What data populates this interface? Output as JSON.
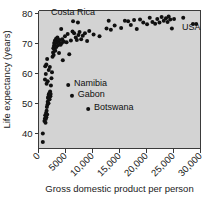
{
  "chart_data": {
    "type": "scatter",
    "title": "",
    "xlabel": "Gross domestic product per person",
    "ylabel": "Life expectancy (years)",
    "xlim": [
      0,
      30000
    ],
    "ylim": [
      35,
      81
    ],
    "grid": false,
    "legend": null,
    "xticks": [
      {
        "value": 0,
        "label": "0"
      },
      {
        "value": 5000,
        "label": "5000"
      },
      {
        "value": 10000,
        "label": "10,000"
      },
      {
        "value": 15000,
        "label": "15,000"
      },
      {
        "value": 20000,
        "label": "20,000"
      },
      {
        "value": 25000,
        "label": "25,000"
      },
      {
        "value": 30000,
        "label": "30,000"
      }
    ],
    "yticks": [
      {
        "value": 40,
        "label": "40"
      },
      {
        "value": 50,
        "label": "50"
      },
      {
        "value": 60,
        "label": "60"
      },
      {
        "value": 70,
        "label": "70"
      },
      {
        "value": 80,
        "label": "80"
      }
    ],
    "marker": {
      "shape": "circle",
      "color": "#101010",
      "size": 2.0
    },
    "annotations": [
      {
        "text": "Costa Rica",
        "x": 6400,
        "y": 79.6,
        "anchor": "mid",
        "dx": 0,
        "dy": 0
      },
      {
        "text": "Namibia",
        "x": 6000,
        "y": 56.2,
        "anchor": "left",
        "dx": 3,
        "dy": 1
      },
      {
        "text": "Gabon",
        "x": 6700,
        "y": 52.6,
        "anchor": "left",
        "dx": 3,
        "dy": 1
      },
      {
        "text": "Botswana",
        "x": 9700,
        "y": 48.2,
        "anchor": "left",
        "dx": 3,
        "dy": 1
      },
      {
        "text": "USA",
        "x": 28300,
        "y": 74.6,
        "anchor": "mid",
        "dx": 0,
        "dy": 0
      }
    ],
    "labeled_points": [
      {
        "name": "Costa Rica",
        "x": 6400,
        "y": 77.4
      },
      {
        "name": "Namibia",
        "x": 5500,
        "y": 56.2
      },
      {
        "name": "Gabon",
        "x": 6200,
        "y": 52.6
      },
      {
        "name": "Botswana",
        "x": 9200,
        "y": 48.2
      },
      {
        "name": "USA",
        "x": 28600,
        "y": 76.5
      },
      {
        "name": "USA-2",
        "x": 29200,
        "y": 76.5
      }
    ],
    "points": [
      [
        800,
        37.2
      ],
      [
        800,
        40.0
      ],
      [
        1100,
        44.2
      ],
      [
        1200,
        45.0
      ],
      [
        1250,
        46.1
      ],
      [
        1300,
        43.6
      ],
      [
        1350,
        44.8
      ],
      [
        1400,
        46.8
      ],
      [
        1450,
        45.4
      ],
      [
        1500,
        47.6
      ],
      [
        1550,
        48.8
      ],
      [
        1600,
        46.3
      ],
      [
        1650,
        49.6
      ],
      [
        1700,
        50.6
      ],
      [
        1750,
        51.8
      ],
      [
        1800,
        52.2
      ],
      [
        1850,
        50.1
      ],
      [
        1900,
        53.0
      ],
      [
        1950,
        52.6
      ],
      [
        2000,
        53.4
      ],
      [
        2050,
        51.4
      ],
      [
        2100,
        52.9
      ],
      [
        2150,
        54.0
      ],
      [
        2200,
        52.4
      ],
      [
        2250,
        53.2
      ],
      [
        1200,
        58.0
      ],
      [
        1350,
        59.8
      ],
      [
        1500,
        56.6
      ],
      [
        1700,
        57.4
      ],
      [
        1900,
        61.2
      ],
      [
        1250,
        62.4
      ],
      [
        1450,
        63.0
      ],
      [
        1600,
        64.8
      ],
      [
        2100,
        62.2
      ],
      [
        2300,
        56.0
      ],
      [
        2400,
        58.4
      ],
      [
        2500,
        60.4
      ],
      [
        2600,
        65.6
      ],
      [
        2700,
        67.0
      ],
      [
        2750,
        68.4
      ],
      [
        2800,
        66.2
      ],
      [
        2850,
        69.2
      ],
      [
        2900,
        70.2
      ],
      [
        2950,
        68.0
      ],
      [
        3000,
        69.8
      ],
      [
        3050,
        71.0
      ],
      [
        3100,
        67.6
      ],
      [
        3150,
        70.6
      ],
      [
        3200,
        69.0
      ],
      [
        3250,
        71.6
      ],
      [
        3300,
        68.8
      ],
      [
        3400,
        70.4
      ],
      [
        3500,
        72.0
      ],
      [
        3600,
        69.4
      ],
      [
        3700,
        70.8
      ],
      [
        3800,
        66.8
      ],
      [
        3900,
        71.2
      ],
      [
        4000,
        70.0
      ],
      [
        4100,
        69.6
      ],
      [
        4200,
        74.8
      ],
      [
        4300,
        70.2
      ],
      [
        4400,
        71.4
      ],
      [
        4500,
        64.4
      ],
      [
        4700,
        70.6
      ],
      [
        4900,
        72.4
      ],
      [
        5200,
        70.4
      ],
      [
        5400,
        73.2
      ],
      [
        5700,
        66.4
      ],
      [
        6000,
        71.0
      ],
      [
        6300,
        74.0
      ],
      [
        6600,
        73.4
      ],
      [
        6900,
        72.0
      ],
      [
        7100,
        71.2
      ],
      [
        7300,
        77.0
      ],
      [
        7400,
        72.8
      ],
      [
        7600,
        73.8
      ],
      [
        7900,
        71.4
      ],
      [
        8200,
        72.6
      ],
      [
        8600,
        73.4
      ],
      [
        9000,
        70.8
      ],
      [
        9400,
        74.2
      ],
      [
        10200,
        73.0
      ],
      [
        11300,
        72.4
      ],
      [
        12600,
        75.0
      ],
      [
        13000,
        77.6
      ],
      [
        13400,
        74.6
      ],
      [
        14100,
        76.0
      ],
      [
        15300,
        75.2
      ],
      [
        16000,
        77.6
      ],
      [
        16600,
        77.4
      ],
      [
        17100,
        76.2
      ],
      [
        17700,
        77.8
      ],
      [
        18200,
        74.8
      ],
      [
        18800,
        78.0
      ],
      [
        19400,
        77.0
      ],
      [
        20100,
        76.4
      ],
      [
        20600,
        78.6
      ],
      [
        21100,
        77.2
      ],
      [
        21600,
        76.6
      ],
      [
        22000,
        78.2
      ],
      [
        22400,
        77.0
      ],
      [
        22800,
        78.8
      ],
      [
        23200,
        77.6
      ],
      [
        23600,
        78.4
      ],
      [
        23900,
        77.2
      ],
      [
        24100,
        79.0
      ],
      [
        24400,
        78.0
      ],
      [
        24700,
        75.0
      ],
      [
        25100,
        78.2
      ],
      [
        26800,
        78.6
      ]
    ]
  }
}
